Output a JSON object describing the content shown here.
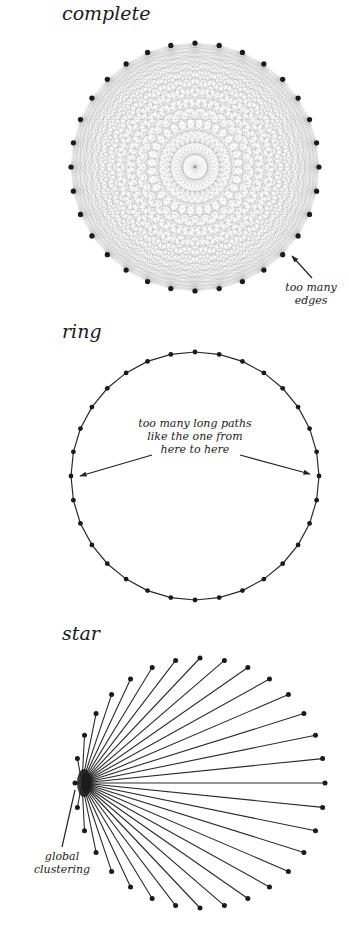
{
  "panels": {
    "complete": {
      "title": "complete",
      "annotation": [
        "too many",
        "edges"
      ],
      "node_count": 32,
      "center": [
        195,
        167
      ],
      "radius": 124
    },
    "ring": {
      "title": "ring",
      "annotation": [
        "too many long paths",
        "like the one from",
        "here to here"
      ],
      "node_count": 32,
      "center": [
        195,
        476
      ],
      "radius": 124
    },
    "star": {
      "title": "star",
      "annotation": [
        "global",
        "clustering"
      ],
      "leaf_count": 32,
      "hub": [
        82,
        783
      ],
      "leaf_center": [
        200,
        783
      ],
      "leaf_radius": 125
    }
  },
  "colors": {
    "node": "#1a1a1a",
    "edge": "#2a2a2a",
    "complete_edge": "rgba(40,40,40,0.16)",
    "text": "#1a1a1a"
  }
}
